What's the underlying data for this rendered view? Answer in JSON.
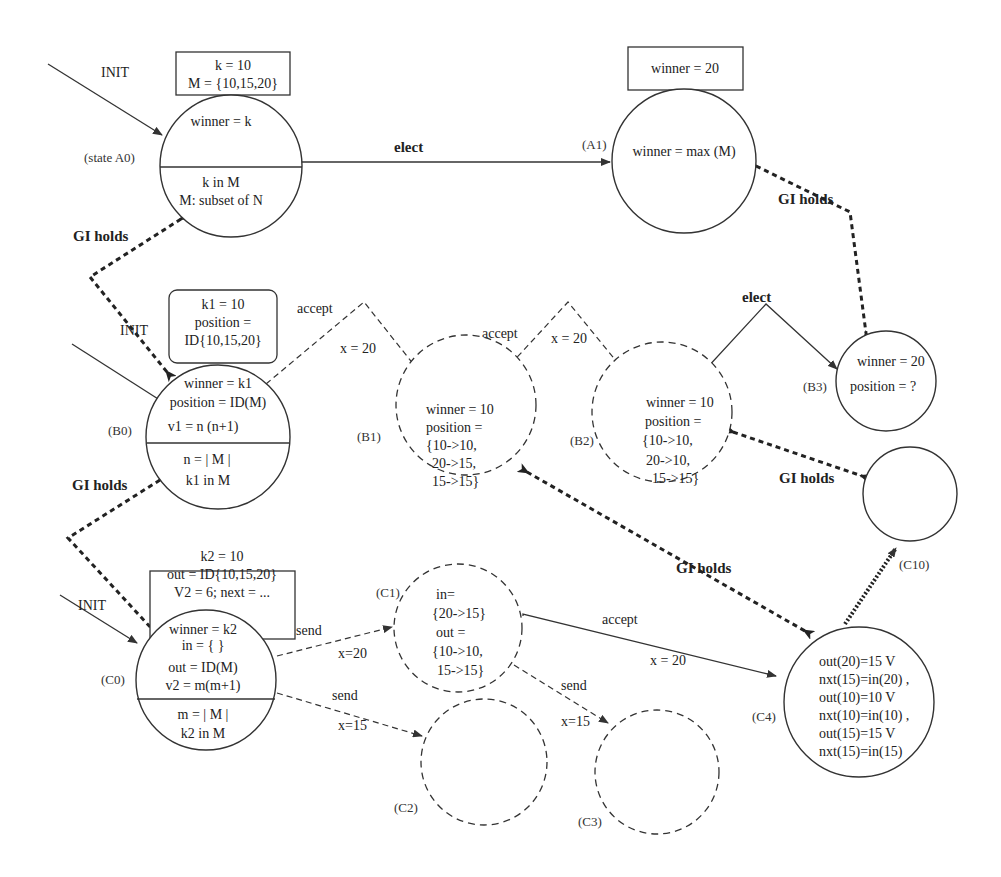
{
  "diagram": {
    "states": {
      "A0": {
        "label": "(state A0)",
        "top": [
          "winner =  k"
        ],
        "bottom": [
          "k in M",
          "M: subset of N"
        ],
        "box": [
          "k = 10",
          "M = {10,15,20}"
        ]
      },
      "A1": {
        "label": "(A1)",
        "body": [
          "winner = max (M)"
        ],
        "box": [
          "winner = 20"
        ]
      },
      "B0": {
        "label": "(B0)",
        "top": [
          "winner = k1",
          "position = ID(M)",
          "v1 = n (n+1)"
        ],
        "bottom": [
          "n = | M |",
          "k1 in M"
        ],
        "box": [
          "k1 = 10",
          "position =",
          "ID{10,15,20}"
        ]
      },
      "B1": {
        "label": "(B1)",
        "body": [
          "winner = 10",
          "position =",
          "{10->10,",
          "20->15,",
          "15->15}"
        ]
      },
      "B2": {
        "label": "(B2)",
        "body": [
          "winner = 10",
          "position =",
          "{10->10,",
          "20->10,",
          "15->15}"
        ]
      },
      "B3": {
        "label": "(B3)",
        "body": [
          "winner = 20",
          "position = ?"
        ]
      },
      "C0": {
        "label": "(C0)",
        "top": [
          "winner = k2",
          "in = { }",
          "out = ID(M)",
          "v2 = m(m+1)"
        ],
        "bottom": [
          "m = | M |",
          "k2 in M"
        ],
        "box": [
          "k2 = 10",
          "out = ID{10,15,20}",
          "V2 = 6; next = ..."
        ]
      },
      "C1": {
        "label": "(C1)",
        "body": [
          "in=",
          "{20->15}",
          "out =",
          "{10->10,",
          "15->15}"
        ]
      },
      "C2": {
        "label": "(C2)",
        "body": []
      },
      "C3": {
        "label": "(C3)",
        "body": []
      },
      "C4": {
        "label": "(C4)",
        "body": [
          "out(20)=15 V",
          "nxt(15)=in(20) ,",
          "out(10)=10 V",
          "nxt(10)=in(10) ,",
          "out(15)=15 V",
          "nxt(15)=in(15)"
        ]
      },
      "C10": {
        "label": "(C10)",
        "body": []
      }
    },
    "edges": {
      "init_a0": "INIT",
      "init_b0": "INIT",
      "init_c0": "INIT",
      "elect_a0_a1": "elect",
      "elect_b2_b3": "elect",
      "accept_b0_b1": "accept",
      "accept_b0_b1_guard": "x = 20",
      "accept_b1_b2": "accept",
      "accept_b1_b2_guard": "x = 20",
      "send_c0_c1": "send",
      "send_c0_c1_guard": "x=20",
      "send_c0_c2": "send",
      "send_c0_c2_guard": "x=15",
      "send_c1_c3": "send",
      "send_c1_c3_guard": "x=15",
      "accept_c1_c4": "accept",
      "accept_c1_c4_guard": "x = 20"
    },
    "gi_holds": {
      "a0_b0": "GI holds",
      "a1_b3": "GI holds",
      "b0_c0": "GI holds",
      "b1_c4": "GI holds",
      "b2_c10": "GI holds"
    }
  }
}
